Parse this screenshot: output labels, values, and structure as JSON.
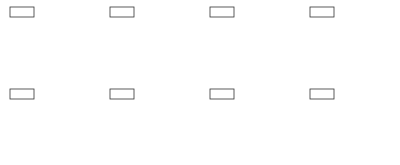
{
  "figure": {
    "colors": {
      "node_stroke": "#333333",
      "node_fill": "#ffffff",
      "source_fill": "#c8c8c8",
      "edge": "#555555",
      "text": "#222222"
    },
    "edge_weights": {
      "source_mid": "4.1",
      "top_mid": "3.5",
      "top_bottom": "3.6",
      "right_bottom": "2.1",
      "mid_bottom": "0.2"
    },
    "panels": [
      {
        "label": "t = 0",
        "source": "0",
        "top": "6.5",
        "right": "5",
        "mid": "3.1",
        "bottom": "2.9"
      },
      {
        "label": "t = 1",
        "source": "0",
        "top": "6.5",
        "right": "5",
        "mid": "3.1",
        "bottom": "3.3"
      },
      {
        "label": "t = 2",
        "source": "0",
        "top": "6.6",
        "right": "5.4",
        "mid": "3.5",
        "bottom": "3.3"
      },
      {
        "label": "t = 3",
        "source": "0",
        "top": "6.9",
        "right": "5.4",
        "mid": "3.5",
        "bottom": "3.7"
      },
      {
        "label": "t = 4",
        "source": "0",
        "top": "7",
        "right": "5.8",
        "mid": "3.9",
        "bottom": "3.7"
      },
      {
        "label": "t = 5",
        "source": "0",
        "top": "7.3",
        "right": "5.8",
        "mid": "3.9",
        "bottom": "4.1"
      },
      {
        "label": "t = 6",
        "source": "0",
        "top": "7.4",
        "right": "6.2",
        "mid": "4.1",
        "bottom": "4.1"
      },
      {
        "label": "t = 8",
        "source": "0",
        "top": "7.6",
        "right": "6.4",
        "mid": "4.1",
        "bottom": "4.3"
      }
    ]
  }
}
